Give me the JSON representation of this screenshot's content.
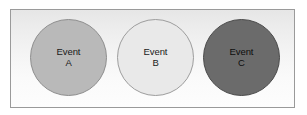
{
  "diagram": {
    "type": "event-circles",
    "frame": {
      "border_color": "#9a9a9a",
      "background_top": "#e6e6e6",
      "background_bottom": "#fdfdfd"
    },
    "circles": [
      {
        "id": "a",
        "title": "Event",
        "letter": "A",
        "fill_color": "#b9b9b9",
        "border_color": "#8e8e8e",
        "text_color": "#1a1a1a"
      },
      {
        "id": "b",
        "title": "Event",
        "letter": "B",
        "fill_color": "#e9e9e9",
        "border_color": "#9d9d9d",
        "text_color": "#1a1a1a"
      },
      {
        "id": "c",
        "title": "Event",
        "letter": "C",
        "fill_color": "#6b6b6b",
        "border_color": "#4a4a4a",
        "text_color": "#0d0d0d"
      }
    ]
  }
}
